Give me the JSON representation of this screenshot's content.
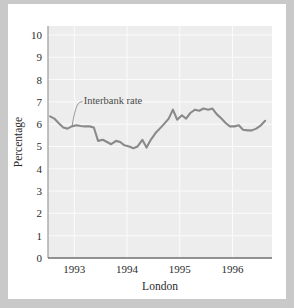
{
  "figure": {
    "background_color": "#c9c9c9",
    "card_color": "#ffffff",
    "plot_background_color": "#ededed",
    "gridline_color": "#fbfbfb",
    "axis_color": "#808080",
    "series_color": "#8a8a8a",
    "text_color": "#2b2b2b"
  },
  "chart_data": {
    "type": "line",
    "title": "",
    "subtitle": "",
    "xlabel": "London",
    "ylabel": "Percentage",
    "ylim": [
      0,
      10.4
    ],
    "xlim": [
      1992.5,
      1996.75
    ],
    "grid": true,
    "legend_position": "none",
    "ytick_labels": [
      "0",
      "1",
      "2",
      "3",
      "4",
      "5",
      "6",
      "7",
      "8",
      "9",
      "10"
    ],
    "yticks": [
      0,
      1,
      2,
      3,
      4,
      5,
      6,
      7,
      8,
      9,
      10
    ],
    "xtick_labels": [
      "1993",
      "1994",
      "1995",
      "1996"
    ],
    "xticks": [
      1993,
      1994,
      1995,
      1996
    ],
    "annotations": [
      {
        "text": "Interbank rate",
        "x": 1993.12,
        "y": 7.05,
        "leader_to_x": 1992.96,
        "leader_to_y": 5.95
      }
    ],
    "series": [
      {
        "name": "Interbank rate",
        "x": [
          1992.54,
          1992.62,
          1992.7,
          1992.79,
          1992.87,
          1992.95,
          1993.04,
          1993.12,
          1993.2,
          1993.29,
          1993.37,
          1993.45,
          1993.54,
          1993.62,
          1993.7,
          1993.79,
          1993.87,
          1993.95,
          1994.04,
          1994.12,
          1994.2,
          1994.29,
          1994.37,
          1994.45,
          1994.54,
          1994.62,
          1994.7,
          1994.79,
          1994.87,
          1994.95,
          1995.04,
          1995.12,
          1995.2,
          1995.29,
          1995.37,
          1995.45,
          1995.54,
          1995.62,
          1995.7,
          1995.79,
          1995.87,
          1995.95,
          1996.04,
          1996.12,
          1996.2,
          1996.29,
          1996.37,
          1996.45,
          1996.54,
          1996.62
        ],
        "values": [
          6.35,
          6.25,
          6.05,
          5.85,
          5.8,
          5.9,
          5.95,
          5.92,
          5.9,
          5.9,
          5.85,
          5.25,
          5.3,
          5.2,
          5.1,
          5.25,
          5.2,
          5.05,
          5.0,
          4.92,
          5.0,
          5.3,
          4.95,
          5.3,
          5.6,
          5.8,
          6.0,
          6.25,
          6.65,
          6.2,
          6.4,
          6.25,
          6.5,
          6.65,
          6.6,
          6.7,
          6.65,
          6.7,
          6.45,
          6.25,
          6.05,
          5.9,
          5.9,
          5.95,
          5.75,
          5.72,
          5.72,
          5.8,
          5.95,
          6.15
        ]
      }
    ]
  }
}
